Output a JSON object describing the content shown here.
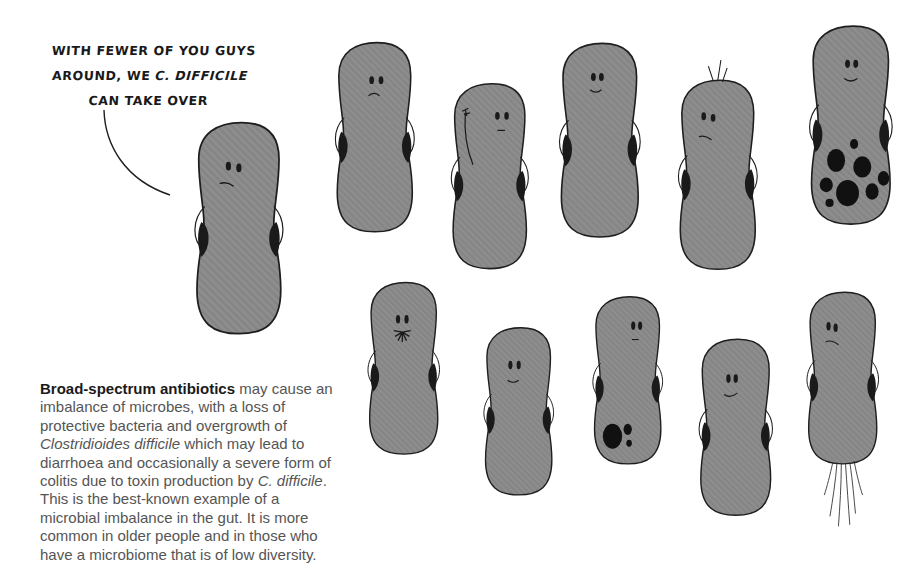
{
  "speech_bubble": {
    "line1": "WITH FEWER OF YOU GUYS",
    "line2_prefix": "AROUND, WE ",
    "line2_italic": "C. DIFFICILE",
    "line3": "CAN TAKE OVER"
  },
  "caption": {
    "bold_lead": "Broad-spectrum antibiotics",
    "text_1": " may cause an imbalance of microbes, with a loss of protective bacteria and overgrowth of ",
    "italic_1": "Clostridioides difficile",
    "text_2": " which may lead to diarrhoea and occasionally a severe form of colitis due to toxin production by ",
    "italic_2": "C. difficile",
    "text_3": ". This is the best-known example of a microbial imbalance in the gut. It is more common in older people and in those who have a microbiome that is of low diversity."
  },
  "colors": {
    "bacteria_fill": "#8c8c8c",
    "outline": "#1e1e1e",
    "caption_text": "#555555",
    "caption_bold": "#1a1a1a"
  },
  "bacteria": [
    {
      "id": "speaker",
      "expression": "frown",
      "feature": "none"
    },
    {
      "id": "top-1",
      "expression": "frown",
      "feature": "none"
    },
    {
      "id": "top-2",
      "expression": "flat",
      "feature": "flagellum-arm"
    },
    {
      "id": "top-3",
      "expression": "smile",
      "feature": "none"
    },
    {
      "id": "top-4",
      "expression": "flat",
      "feature": "hair-tuft"
    },
    {
      "id": "top-5",
      "expression": "smile",
      "feature": "many-spores"
    },
    {
      "id": "bottom-1",
      "expression": "mustache",
      "feature": "none"
    },
    {
      "id": "bottom-2",
      "expression": "smile",
      "feature": "none"
    },
    {
      "id": "bottom-3",
      "expression": "flat",
      "feature": "few-spores"
    },
    {
      "id": "bottom-4",
      "expression": "smile",
      "feature": "none"
    },
    {
      "id": "bottom-5",
      "expression": "frown",
      "feature": "tail-flagella"
    }
  ]
}
